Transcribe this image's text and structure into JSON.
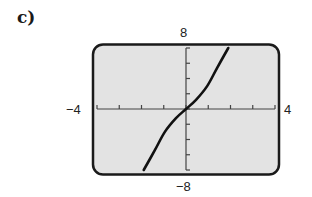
{
  "panel": {
    "label": "c)"
  },
  "window": {
    "xmin_label": "−4",
    "xmax_label": "4",
    "ymin_label": "−8",
    "ymax_label": "8"
  },
  "colors": {
    "screen_bg": "#e3e3e3",
    "frame": "#1a1a1a",
    "curve": "#111111",
    "axis": "#444444"
  },
  "chart_data": {
    "type": "line",
    "title": "c)",
    "xlabel": "",
    "ylabel": "",
    "xlim": [
      -4,
      4
    ],
    "ylim": [
      -8,
      8
    ],
    "x_ticks_step": 1,
    "y_ticks_step": 2,
    "tick_labels": {
      "x": [
        "−4",
        "4"
      ],
      "y": [
        "−8",
        "8"
      ]
    },
    "grid": false,
    "legend": null,
    "series": [
      {
        "name": "curve",
        "x": [
          -1.9,
          -1.4,
          -0.95,
          -0.45,
          0,
          0.45,
          0.95,
          1.4,
          1.9
        ],
        "y": [
          -8,
          -5.4,
          -3,
          -1.2,
          0,
          1.2,
          3,
          5.4,
          8
        ]
      }
    ]
  }
}
